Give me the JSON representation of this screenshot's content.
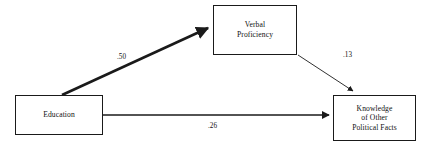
{
  "diagram": {
    "type": "path-diagram",
    "title": "",
    "nodes": [
      {
        "id": "education",
        "label": "Education",
        "x": 15,
        "y": 95,
        "width": 88,
        "height": 40
      },
      {
        "id": "verbal_proficiency",
        "label": "Verbal\nProficiency",
        "x": 213,
        "y": 5,
        "width": 84,
        "height": 50
      },
      {
        "id": "knowledge",
        "label": "Knowledge\nof Other\nPolitical Facts",
        "x": 333,
        "y": 95,
        "width": 83,
        "height": 46
      }
    ],
    "edges": [
      {
        "id": "edu-to-verbal",
        "from": "education",
        "to": "verbal_proficiency",
        "coefficient": ".50",
        "weight": "thick"
      },
      {
        "id": "verbal-to-knowledge",
        "from": "verbal_proficiency",
        "to": "knowledge",
        "coefficient": ".13",
        "weight": "thin"
      },
      {
        "id": "edu-to-knowledge",
        "from": "education",
        "to": "knowledge",
        "coefficient": ".26",
        "weight": "medium"
      }
    ],
    "colors": {
      "line": "#1a1a1a",
      "box_border": "#1a1a1a",
      "background": "#ffffff",
      "text": "#111111"
    }
  }
}
